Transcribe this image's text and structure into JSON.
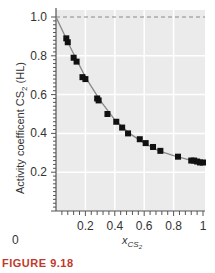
{
  "chart_data": {
    "type": "scatter",
    "title": "",
    "xlabel": "x_CS2",
    "ylabel": "Activity coefficent CS2 (HL)",
    "xlim": [
      0,
      1
    ],
    "ylim": [
      0,
      1.0
    ],
    "grid": true,
    "x_ticks": [
      "0",
      "0.2",
      "0.4",
      "0.6",
      "0.8",
      "1"
    ],
    "y_ticks": [
      "0.2",
      "0.4",
      "0.6",
      "0.8",
      "1.0"
    ],
    "reference_line": {
      "y": 1.0,
      "style": "dashed"
    },
    "series": [
      {
        "name": "data",
        "marker": "square",
        "x": [
          0.07,
          0.08,
          0.12,
          0.14,
          0.18,
          0.2,
          0.28,
          0.29,
          0.35,
          0.41,
          0.45,
          0.49,
          0.57,
          0.61,
          0.66,
          0.71,
          0.83,
          0.92,
          0.94,
          0.96,
          0.98,
          1.0
        ],
        "y": [
          0.89,
          0.87,
          0.79,
          0.77,
          0.69,
          0.68,
          0.58,
          0.57,
          0.5,
          0.46,
          0.43,
          0.4,
          0.37,
          0.35,
          0.33,
          0.31,
          0.28,
          0.26,
          0.26,
          0.255,
          0.25,
          0.25
        ]
      },
      {
        "name": "fit",
        "line": "solid",
        "x": [
          0,
          0.1,
          0.2,
          0.3,
          0.4,
          0.5,
          0.6,
          0.7,
          0.8,
          0.9,
          1.0
        ],
        "y": [
          1.0,
          0.84,
          0.69,
          0.57,
          0.47,
          0.4,
          0.35,
          0.31,
          0.285,
          0.265,
          0.25
        ]
      }
    ]
  },
  "labels": {
    "y_axis": "Activity coefficent CS",
    "y_axis_sub": "2",
    "y_axis_tail": " (HL)",
    "x_axis": "x",
    "x_axis_sub": "CS",
    "x_axis_subsub": "2",
    "origin": "0"
  },
  "caption": {
    "label": "FIGURE",
    "number": "9.18"
  }
}
